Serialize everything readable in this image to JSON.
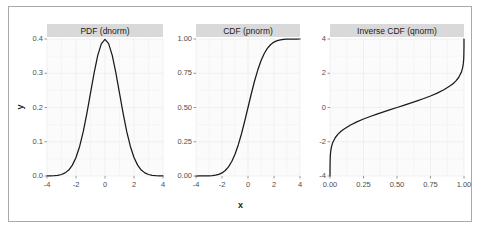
{
  "figure": {
    "background_color": "#ffffff",
    "border_color": "#a9a9a9",
    "panel_background_color": "#fbfbfb",
    "grid_color": "#ededed",
    "strip_background_color": "#d9d9d9",
    "line_color": "#1a1a1a",
    "axis_text_color": "#4d4d4d",
    "axis_title_color": "#1a1a1a",
    "xlabel": "x",
    "ylabel": "y"
  },
  "chart_data": [
    {
      "type": "line",
      "title": "PDF (dnorm)",
      "xlabel": "x",
      "ylabel": "y",
      "grid": true,
      "legend": "none",
      "xlim": [
        -4,
        4
      ],
      "ylim": [
        0,
        0.4
      ],
      "xticks": [
        "-4",
        "-2",
        "0",
        "2",
        "4"
      ],
      "xtick_values": [
        -4,
        -2,
        0,
        2,
        4
      ],
      "yticks": [
        "0.0",
        "0.1",
        "0.2",
        "0.3",
        "0.4"
      ],
      "ytick_values": [
        0.0,
        0.1,
        0.2,
        0.3,
        0.4
      ],
      "x": [
        -4.0,
        -3.75,
        -3.5,
        -3.25,
        -3.0,
        -2.75,
        -2.5,
        -2.25,
        -2.0,
        -1.75,
        -1.5,
        -1.25,
        -1.0,
        -0.75,
        -0.5,
        -0.25,
        0.0,
        0.25,
        0.5,
        0.75,
        1.0,
        1.25,
        1.5,
        1.75,
        2.0,
        2.25,
        2.5,
        2.75,
        3.0,
        3.25,
        3.5,
        3.75,
        4.0
      ],
      "values": [
        0.0001,
        0.0004,
        0.0009,
        0.002,
        0.0044,
        0.0091,
        0.0175,
        0.0317,
        0.054,
        0.0863,
        0.1295,
        0.1826,
        0.242,
        0.3011,
        0.3521,
        0.3867,
        0.3989,
        0.3867,
        0.3521,
        0.3011,
        0.242,
        0.1826,
        0.1295,
        0.0863,
        0.054,
        0.0317,
        0.0175,
        0.0091,
        0.0044,
        0.002,
        0.0009,
        0.0004,
        0.0001
      ]
    },
    {
      "type": "line",
      "title": "CDF (pnorm)",
      "xlabel": "x",
      "ylabel": "y",
      "grid": true,
      "legend": "none",
      "xlim": [
        -4,
        4
      ],
      "ylim": [
        0,
        1
      ],
      "xticks": [
        "-4",
        "-2",
        "0",
        "2",
        "4"
      ],
      "xtick_values": [
        -4,
        -2,
        0,
        2,
        4
      ],
      "yticks": [
        "0.00",
        "0.25",
        "0.50",
        "0.75",
        "1.00"
      ],
      "ytick_values": [
        0.0,
        0.25,
        0.5,
        0.75,
        1.0
      ],
      "x": [
        -4.0,
        -3.75,
        -3.5,
        -3.25,
        -3.0,
        -2.75,
        -2.5,
        -2.25,
        -2.0,
        -1.75,
        -1.5,
        -1.25,
        -1.0,
        -0.75,
        -0.5,
        -0.25,
        0.0,
        0.25,
        0.5,
        0.75,
        1.0,
        1.25,
        1.5,
        1.75,
        2.0,
        2.25,
        2.5,
        2.75,
        3.0,
        3.25,
        3.5,
        3.75,
        4.0
      ],
      "values": [
        3.17e-05,
        8.84e-05,
        0.000233,
        0.000577,
        0.00135,
        0.00298,
        0.00621,
        0.01222,
        0.02275,
        0.04006,
        0.06681,
        0.10565,
        0.15866,
        0.22663,
        0.30854,
        0.40129,
        0.5,
        0.59871,
        0.69146,
        0.77337,
        0.84134,
        0.89435,
        0.93319,
        0.95994,
        0.97725,
        0.98778,
        0.99379,
        0.99702,
        0.99865,
        0.99942,
        0.99977,
        0.99991,
        0.99997
      ]
    },
    {
      "type": "line",
      "title": "Inverse CDF (qnorm)",
      "xlabel": "x",
      "ylabel": "y",
      "grid": true,
      "legend": "none",
      "xlim": [
        0,
        1
      ],
      "ylim": [
        -4,
        4
      ],
      "xticks": [
        "0.00",
        "0.25",
        "0.50",
        "0.75",
        "1.00"
      ],
      "xtick_values": [
        0.0,
        0.25,
        0.5,
        0.75,
        1.0
      ],
      "yticks": [
        "-4",
        "-2",
        "0",
        "2",
        "4"
      ],
      "ytick_values": [
        -4,
        -2,
        0,
        2,
        4
      ],
      "x": [
        3e-05,
        0.0002,
        0.001,
        0.0025,
        0.005,
        0.01,
        0.02,
        0.04,
        0.06,
        0.08,
        0.1,
        0.15,
        0.2,
        0.25,
        0.3,
        0.35,
        0.4,
        0.45,
        0.5,
        0.55,
        0.6,
        0.65,
        0.7,
        0.75,
        0.8,
        0.85,
        0.9,
        0.92,
        0.94,
        0.96,
        0.98,
        0.99,
        0.995,
        0.9975,
        0.999,
        0.9998,
        0.99997
      ],
      "values": [
        -4.0,
        -3.54,
        -3.09,
        -2.81,
        -2.576,
        -2.326,
        -2.054,
        -1.751,
        -1.555,
        -1.405,
        -1.282,
        -1.036,
        -0.842,
        -0.674,
        -0.524,
        -0.385,
        -0.253,
        -0.126,
        0.0,
        0.126,
        0.253,
        0.385,
        0.524,
        0.674,
        0.842,
        1.036,
        1.282,
        1.405,
        1.555,
        1.751,
        2.054,
        2.326,
        2.576,
        2.81,
        3.09,
        3.54,
        4.0
      ]
    }
  ]
}
